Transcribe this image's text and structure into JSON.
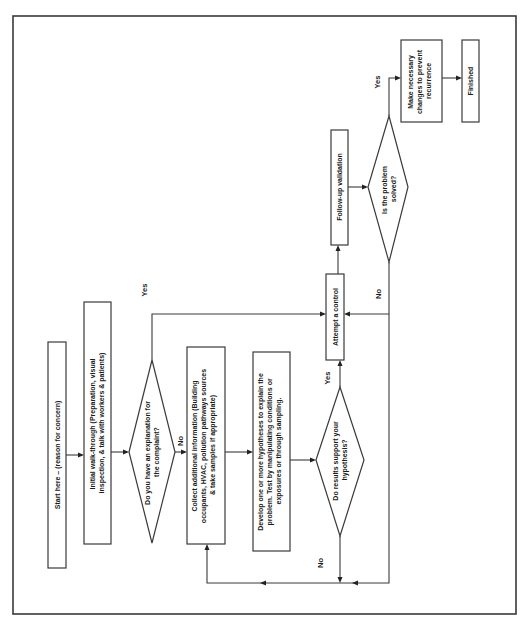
{
  "flowchart": {
    "colors": {
      "stroke": "#3a3a3a",
      "text": "#1a1a1a",
      "background": "#ffffff"
    },
    "orientation": "rotated-90-ccw",
    "nodes": {
      "start": {
        "type": "process",
        "lines": [
          "Start here – (reason for concern)"
        ]
      },
      "walkthrough": {
        "type": "process",
        "lines": [
          "Initial walk-through (Preparation, visual",
          "inspection, &  talk with workers & patients)"
        ]
      },
      "explanation": {
        "type": "decision",
        "lines": [
          "Do you have an explanation for",
          "the complaint?"
        ]
      },
      "collect": {
        "type": "process",
        "lines": [
          "Collect additional information (Building",
          "occupants, HVAC, pollution pathways sources",
          "& take samples if appropriate)"
        ]
      },
      "develop": {
        "type": "process",
        "lines": [
          "Develop one or more hypotheses to explain the",
          "problem.  Test by manipulating conditions or",
          "exposures or through sampling."
        ]
      },
      "support": {
        "type": "decision",
        "lines": [
          "Do results support your",
          "hypothesis?"
        ]
      },
      "attempt": {
        "type": "process",
        "lines": [
          "Attempt a control"
        ]
      },
      "followup": {
        "type": "process",
        "lines": [
          "Follow-up validation"
        ]
      },
      "solved": {
        "type": "decision",
        "lines": [
          "Is the problem",
          "solved?"
        ]
      },
      "changes": {
        "type": "process",
        "lines": [
          "Make necessary",
          "changes to prevent",
          "recurrence"
        ]
      },
      "finished": {
        "type": "process",
        "lines": [
          "Finished"
        ]
      }
    },
    "edge_labels": {
      "explanation_yes": "Yes",
      "explanation_no": "No",
      "support_yes": "Yes",
      "support_no": "No",
      "solved_yes": "Yes",
      "solved_no": "No"
    },
    "edges": [
      [
        "start",
        "walkthrough",
        ""
      ],
      [
        "walkthrough",
        "explanation",
        ""
      ],
      [
        "explanation",
        "collect",
        "No"
      ],
      [
        "explanation",
        "attempt",
        "Yes"
      ],
      [
        "collect",
        "develop",
        ""
      ],
      [
        "develop",
        "support",
        ""
      ],
      [
        "support",
        "attempt",
        "Yes"
      ],
      [
        "support",
        "collect",
        "No"
      ],
      [
        "attempt",
        "followup",
        ""
      ],
      [
        "followup",
        "solved",
        ""
      ],
      [
        "solved",
        "changes",
        "Yes"
      ],
      [
        "solved",
        "attempt",
        "No"
      ],
      [
        "changes",
        "finished",
        ""
      ]
    ]
  }
}
